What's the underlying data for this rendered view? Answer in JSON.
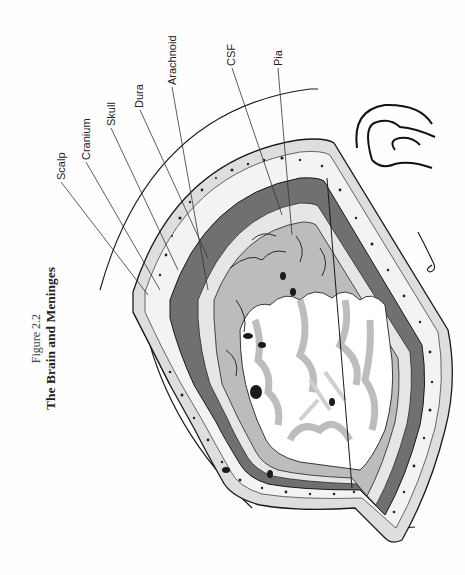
{
  "figure": {
    "number": "Figure 2.2",
    "title": "The Brain and Meninges",
    "orientation": "rotated 90° counter-clockwise",
    "labels": [
      {
        "id": "scalp",
        "text": "Scalp"
      },
      {
        "id": "cranium",
        "text": "Cranium"
      },
      {
        "id": "skull",
        "text": "Skull"
      },
      {
        "id": "dura",
        "text": "Dura"
      },
      {
        "id": "arachnoid",
        "text": "Arachnoid"
      },
      {
        "id": "csf",
        "text": "CSF"
      },
      {
        "id": "pia",
        "text": "Pia"
      }
    ],
    "illustration": "Cut-away cross-section of the head showing scalp, skull, meninges and cerebral cortex gyri",
    "inset": "Small outline sketch of brain orientation",
    "signature": "artist signature"
  },
  "colors": {
    "ink": "#1a1a1a",
    "dura": "#6e6e6e",
    "scalp": "#d6d6d6",
    "grey_matter": "#bdbdbd",
    "white_matter": "#ffffff",
    "csf": "#e9e9e9",
    "vessel": "#a8a8a8"
  }
}
